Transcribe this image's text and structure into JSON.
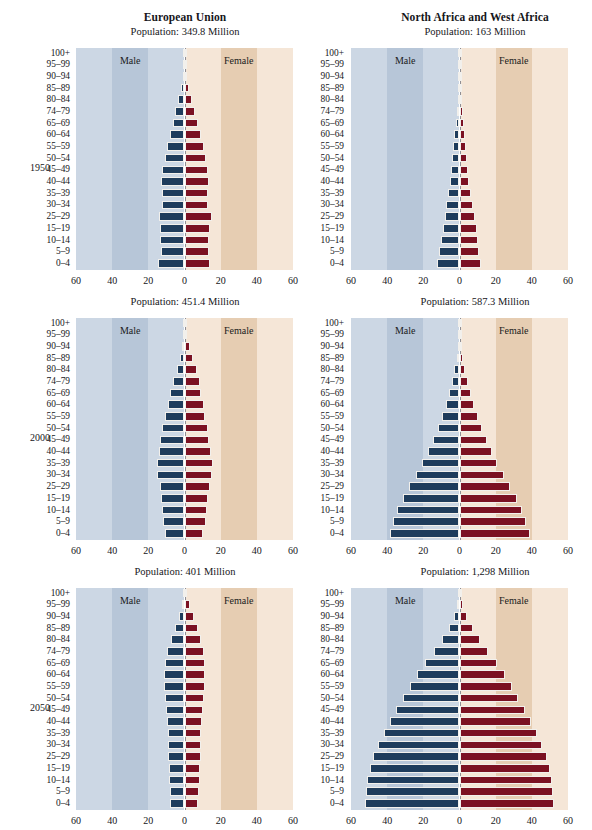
{
  "figure": {
    "columns": [
      {
        "title": "European Union"
      },
      {
        "title": "North Africa and West Africa"
      }
    ],
    "years": [
      "1950",
      "2000",
      "2050"
    ],
    "legend": {
      "male": "Male",
      "female": "Female"
    },
    "colors": {
      "male_bar": "#1e3c5c",
      "female_bar": "#7b1122",
      "band_male_light": "#ccd7e4",
      "band_male_dark": "#b7c6d8",
      "band_female_light": "#f5e6d7",
      "band_female_dark": "#e6cdb2",
      "axis_line": "#8f8f95",
      "text": "#16161a"
    },
    "axis": {
      "x_ticks": [
        60,
        40,
        20,
        0,
        20,
        40,
        60
      ],
      "x_tick_labels": [
        "60",
        "40",
        "20",
        "0",
        "20",
        "40",
        "60"
      ],
      "x_min": -60,
      "x_max": 60,
      "y_categories": [
        "100+",
        "95–99",
        "90–94",
        "85–89",
        "80–84",
        "74–79",
        "65–69",
        "60–64",
        "55–59",
        "50–54",
        "45–49",
        "40–44",
        "35–39",
        "30–34",
        "25–29",
        "15–19",
        "10–14",
        "5–9",
        "0–4"
      ]
    }
  },
  "chart_data": [
    {
      "type": "bar",
      "title": "European Union",
      "subtitle": "Population: 349.8 Million",
      "population_label": "Population: 349.8 Million",
      "year": "1950",
      "region": "European Union",
      "xlabel": "",
      "ylabel": "",
      "xlim": [
        -60,
        60
      ],
      "grid": false,
      "legend_position": "inside-bands",
      "categories": [
        "100+",
        "95–99",
        "90–94",
        "85–89",
        "80–84",
        "74–79",
        "65–69",
        "60–64",
        "55–59",
        "50–54",
        "45–49",
        "40–44",
        "35–39",
        "30–34",
        "25–29",
        "15–19",
        "10–14",
        "5–9",
        "0–4"
      ],
      "series": [
        {
          "name": "Male",
          "values": [
            0.2,
            0.5,
            1.0,
            2.0,
            3.4,
            5.0,
            6.6,
            8.2,
            9.6,
            11.0,
            12.2,
            13.0,
            12.6,
            12.4,
            14.0,
            13.6,
            13.4,
            13.2,
            14.6
          ]
        },
        {
          "name": "Female",
          "values": [
            0.3,
            0.7,
            1.4,
            2.6,
            4.2,
            6.0,
            7.6,
            9.2,
            10.6,
            12.0,
            13.0,
            13.6,
            13.2,
            13.0,
            15.0,
            14.2,
            13.8,
            13.6,
            14.2
          ]
        }
      ]
    },
    {
      "type": "bar",
      "title": "North Africa and West Africa",
      "subtitle": "Population: 163 Million",
      "population_label": "Population: 163 Million",
      "year": "1950",
      "region": "North Africa and West Africa",
      "xlabel": "",
      "ylabel": "",
      "xlim": [
        -60,
        60
      ],
      "grid": false,
      "legend_position": "inside-bands",
      "categories": [
        "100+",
        "95–99",
        "90–94",
        "85–89",
        "80–84",
        "74–79",
        "65–69",
        "60–64",
        "55–59",
        "50–54",
        "45–49",
        "40–44",
        "35–39",
        "30–34",
        "25–29",
        "15–19",
        "10–14",
        "5–9",
        "0–4"
      ],
      "series": [
        {
          "name": "Male",
          "values": [
            0.1,
            0.2,
            0.4,
            0.7,
            1.1,
            1.6,
            2.2,
            2.8,
            3.4,
            4.0,
            4.7,
            5.4,
            6.2,
            7.2,
            8.2,
            9.4,
            10.4,
            11.2,
            12.6
          ]
        },
        {
          "name": "Female",
          "values": [
            0.1,
            0.2,
            0.4,
            0.8,
            1.2,
            1.7,
            2.3,
            2.9,
            3.5,
            4.1,
            4.8,
            5.5,
            6.3,
            7.3,
            8.3,
            9.5,
            10.4,
            11.0,
            12.0
          ]
        }
      ]
    },
    {
      "type": "bar",
      "title": "European Union",
      "subtitle": "Population: 451.4 Million",
      "population_label": "Population: 451.4 Million",
      "year": "2000",
      "region": "European Union",
      "xlabel": "",
      "ylabel": "",
      "xlim": [
        -60,
        60
      ],
      "grid": false,
      "legend_position": "inside-bands",
      "categories": [
        "100+",
        "95–99",
        "90–94",
        "85–89",
        "80–84",
        "74–79",
        "65–69",
        "60–64",
        "55–59",
        "50–54",
        "45–49",
        "40–44",
        "35–39",
        "30–34",
        "25–29",
        "15–19",
        "10–14",
        "5–9",
        "0–4"
      ],
      "series": [
        {
          "name": "Male",
          "values": [
            0.2,
            0.6,
            1.6,
            2.6,
            4.4,
            6.2,
            7.8,
            9.4,
            10.6,
            12.4,
            13.4,
            14.0,
            15.4,
            15.2,
            13.6,
            13.0,
            12.2,
            12.0,
            10.8
          ]
        },
        {
          "name": "Female",
          "values": [
            0.4,
            1.2,
            3.0,
            4.6,
            6.8,
            8.4,
            9.4,
            10.6,
            11.4,
            13.0,
            13.8,
            14.4,
            15.8,
            15.4,
            14.0,
            13.2,
            12.4,
            12.0,
            10.4
          ]
        }
      ]
    },
    {
      "type": "bar",
      "title": "North Africa and West Africa",
      "subtitle": "Population: 587.3 Million",
      "population_label": "Population: 587.3 Million",
      "year": "2000",
      "region": "North Africa and West Africa",
      "xlabel": "",
      "ylabel": "",
      "xlim": [
        -60,
        60
      ],
      "grid": false,
      "legend_position": "inside-bands",
      "categories": [
        "100+",
        "95–99",
        "90–94",
        "85–89",
        "80–84",
        "74–79",
        "65–69",
        "60–64",
        "55–59",
        "50–54",
        "45–49",
        "40–44",
        "35–39",
        "30–34",
        "25–29",
        "15–19",
        "10–14",
        "5–9",
        "0–4"
      ],
      "series": [
        {
          "name": "Male",
          "values": [
            0.1,
            0.3,
            0.8,
            1.6,
            2.8,
            4.2,
            5.8,
            7.6,
            9.6,
            11.8,
            14.6,
            17.4,
            20.6,
            24.0,
            27.8,
            31.4,
            34.4,
            36.6,
            38.6
          ]
        },
        {
          "name": "Female",
          "values": [
            0.1,
            0.4,
            1.0,
            1.9,
            3.2,
            4.6,
            6.2,
            8.0,
            10.0,
            12.2,
            15.0,
            17.8,
            21.0,
            24.4,
            28.2,
            31.8,
            34.6,
            36.6,
            38.8
          ]
        }
      ]
    },
    {
      "type": "bar",
      "title": "European Union",
      "subtitle": "Population: 401 Million",
      "population_label": "Population: 401 Million",
      "year": "2050",
      "region": "European Union",
      "xlabel": "",
      "ylabel": "",
      "xlim": [
        -60,
        60
      ],
      "grid": false,
      "legend_position": "inside-bands",
      "categories": [
        "100+",
        "95–99",
        "90–94",
        "85–89",
        "80–84",
        "74–79",
        "65–69",
        "60–64",
        "55–59",
        "50–54",
        "45–49",
        "40–44",
        "35–39",
        "30–34",
        "25–29",
        "15–19",
        "10–14",
        "5–9",
        "0–4"
      ],
      "series": [
        {
          "name": "Male",
          "values": [
            0.4,
            1.4,
            3.2,
            5.4,
            7.6,
            9.6,
            11.0,
            11.4,
            11.4,
            11.0,
            10.2,
            9.8,
            9.4,
            9.2,
            9.0,
            8.8,
            8.6,
            8.2,
            8.0
          ]
        },
        {
          "name": "Female",
          "values": [
            1.0,
            2.8,
            5.2,
            7.6,
            9.4,
            10.6,
            11.4,
            11.6,
            11.4,
            11.0,
            10.2,
            9.8,
            9.4,
            9.2,
            9.0,
            8.8,
            8.4,
            8.0,
            7.6
          ]
        }
      ]
    },
    {
      "type": "bar",
      "title": "North Africa and West Africa",
      "subtitle": "Population: 1,298 Million",
      "population_label": "Population: 1,298 Million",
      "year": "2050",
      "region": "North Africa and West Africa",
      "xlabel": "",
      "ylabel": "",
      "xlim": [
        -60,
        60
      ],
      "grid": false,
      "legend_position": "inside-bands",
      "categories": [
        "100+",
        "95–99",
        "90–94",
        "85–89",
        "80–84",
        "74–79",
        "65–69",
        "60–64",
        "55–59",
        "50–54",
        "45–49",
        "40–44",
        "35–39",
        "30–34",
        "25–29",
        "15–19",
        "10–14",
        "5–9",
        "0–4"
      ],
      "series": [
        {
          "name": "Male",
          "values": [
            0.4,
            1.2,
            3.0,
            6.0,
            9.6,
            14.0,
            19.0,
            23.6,
            27.6,
            31.4,
            35.2,
            38.6,
            42.0,
            45.2,
            47.8,
            49.6,
            51.0,
            51.6,
            52.2
          ]
        },
        {
          "name": "Female",
          "values": [
            0.6,
            1.8,
            4.2,
            7.6,
            11.6,
            16.0,
            20.6,
            25.0,
            28.8,
            32.6,
            36.2,
            39.6,
            42.8,
            45.8,
            48.2,
            50.0,
            51.2,
            51.8,
            52.4
          ]
        }
      ]
    }
  ]
}
